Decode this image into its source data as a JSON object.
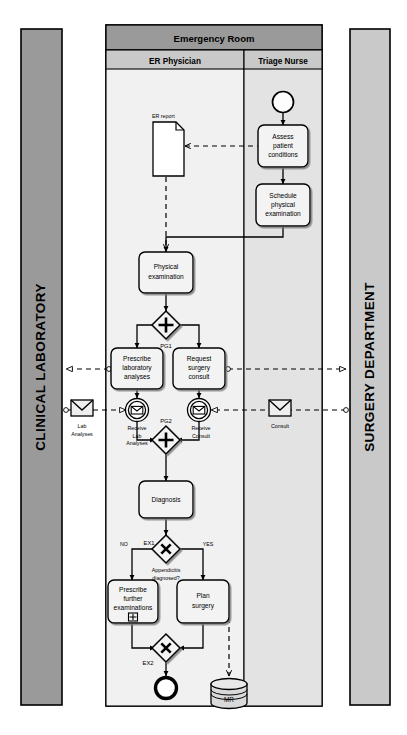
{
  "diagram": {
    "type": "bpmn-collaboration-diagram",
    "canvas": {
      "width": 407,
      "height": 735,
      "background": "#ffffff"
    }
  },
  "colors": {
    "left_pool_fill": "#9a9a9a",
    "right_pool_fill": "#c9c9c9",
    "pool_header_fill": "#9a9a9a",
    "lane_header_fill": "#c9c9c9",
    "lane_body_fill_er": "#f1f1f1",
    "lane_body_fill_triage": "#e3e3e3",
    "task_fill": "#f3f3f3",
    "shape_stroke": "#000000",
    "data_store_fill": "#d9d9d9",
    "envelope_fill": "#f0f0f0"
  },
  "pools": [
    {
      "id": "clinical-laboratory",
      "name": "CLINICAL LABORATORY",
      "orientation": "vertical-collapsed",
      "side": "left"
    },
    {
      "id": "emergency-room",
      "name": "Emergency Room",
      "side": "center",
      "lanes": [
        {
          "id": "er-physician",
          "name": "ER Physician"
        },
        {
          "id": "triage-nurse",
          "name": "Triage Nurse"
        }
      ]
    },
    {
      "id": "surgery-department",
      "name": "SURGERY DEPARTMENT",
      "orientation": "vertical-collapsed",
      "side": "right"
    }
  ],
  "elements": {
    "start_event": {
      "name": "start-event",
      "lane": "triage-nurse",
      "label": ""
    },
    "tasks": [
      {
        "id": "assess-patient-conditions",
        "label": "Assess\npatient\nconditions",
        "lines": [
          "Assess",
          "patient",
          "conditions"
        ],
        "lane": "triage-nurse"
      },
      {
        "id": "schedule-physical-examination",
        "label": "Schedule\nphysical\nexamination",
        "lines": [
          "Schedule",
          "physical",
          "examination"
        ],
        "lane": "triage-nurse"
      },
      {
        "id": "physical-examination",
        "label": "Physical\nexamination",
        "lines": [
          "Physical",
          "examination"
        ],
        "lane": "er-physician"
      },
      {
        "id": "prescribe-laboratory-analyses",
        "label": "Prescribe\nlaboratory\nanalyses",
        "lines": [
          "Prescribe",
          "laboratory",
          "analyses"
        ],
        "lane": "er-physician"
      },
      {
        "id": "request-surgery-consult",
        "label": "Request\nsurgery\nconsult",
        "lines": [
          "Request",
          "surgery",
          "consult"
        ],
        "lane": "er-physician"
      },
      {
        "id": "diagnosis",
        "label": "Diagnosis",
        "lines": [
          "Diagnosis"
        ],
        "lane": "er-physician"
      },
      {
        "id": "prescribe-further-examinations",
        "label": "Prescribe\nfurther\nexaminations",
        "lines": [
          "Prescribe",
          "further",
          "examinations"
        ],
        "lane": "er-physician",
        "marker": "collapsed-subprocess"
      },
      {
        "id": "plan-surgery",
        "label": "Plan\nsurgery",
        "lines": [
          "Plan",
          "surgery"
        ],
        "lane": "er-physician"
      }
    ],
    "gateways": [
      {
        "id": "pg1",
        "label": "PG1",
        "kind": "parallel",
        "symbol": "+"
      },
      {
        "id": "pg2",
        "label": "PG2",
        "kind": "parallel",
        "symbol": "+"
      },
      {
        "id": "ex1",
        "label": "EX1",
        "kind": "exclusive",
        "symbol": "X",
        "question": "Appendicitis\ndiagnosed?",
        "question_lines": [
          "Appendicitis",
          "diagnosed?"
        ]
      },
      {
        "id": "ex2",
        "label": "EX2",
        "kind": "exclusive",
        "symbol": "X"
      }
    ],
    "intermediate_events": [
      {
        "id": "receive-lab-analyses",
        "label": "Receive\nLab\nAnalyses",
        "lines": [
          "Receive",
          "Lab",
          "Analyses"
        ],
        "kind": "message-catch"
      },
      {
        "id": "receive-consult",
        "label": "Receive\nConsult",
        "lines": [
          "Receive",
          "Consult"
        ],
        "kind": "message-catch"
      }
    ],
    "messages": [
      {
        "id": "lab-analyses-message",
        "label": "Lab\nAnalyses",
        "lines": [
          "Lab",
          "Analyses"
        ]
      },
      {
        "id": "consult-message",
        "label": "Consult",
        "lines": [
          "Consult"
        ]
      }
    ],
    "data_objects": [
      {
        "id": "er-report",
        "label": "ER report"
      }
    ],
    "data_stores": [
      {
        "id": "mr-data-store",
        "label": "MR"
      }
    ],
    "end_event": {
      "name": "end-event",
      "lane": "er-physician",
      "label": ""
    },
    "flow_labels": [
      {
        "id": "ex1-no",
        "text": "NO"
      },
      {
        "id": "ex1-yes",
        "text": "YES"
      }
    ]
  }
}
